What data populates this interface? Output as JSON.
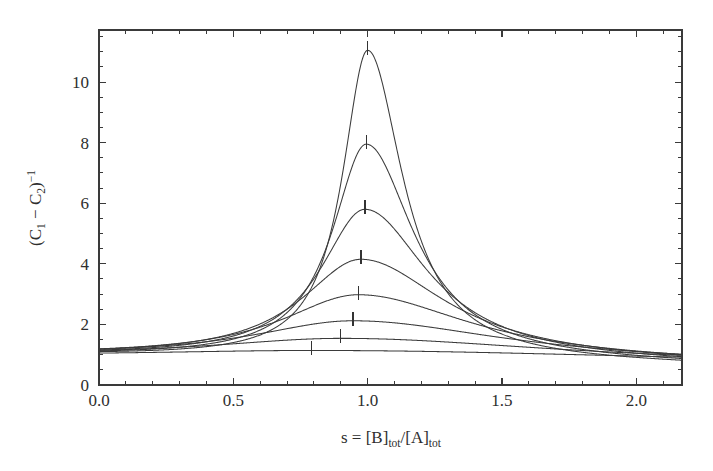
{
  "figure": {
    "background_color": "#ffffff",
    "line_color": "#3b3b3b",
    "text_color": "#2e2e2e",
    "frame_color": "#3a3a3a"
  },
  "axes": {
    "x": {
      "title_parts": {
        "variable": "s",
        "equals": " = ",
        "numerator_bracket_open": "[B]",
        "numerator_sub": "tot",
        "slash": "/",
        "denominator_bracket_open": "[A]",
        "denominator_sub": "tot"
      },
      "title_plain": "s = [B]tot/[A]tot",
      "tick_labels": [
        "0.0",
        "0.5",
        "1.0",
        "1.5",
        "2.0"
      ],
      "tick_values": [
        0.0,
        0.5,
        1.0,
        1.5,
        2.0
      ],
      "minor_tick_step": 0.1,
      "range": [
        0.0,
        2.17
      ]
    },
    "y": {
      "title_parts": {
        "paren_open": "(C",
        "sub1": "1",
        "minus": " − C",
        "sub2": "2",
        "paren_close": ")",
        "exponent": "−1"
      },
      "title_plain": "(C1 − C2)⁻¹",
      "tick_labels": [
        "0",
        "2",
        "4",
        "6",
        "8",
        "10"
      ],
      "tick_values": [
        0,
        2,
        4,
        6,
        8,
        10
      ],
      "minor_tick_step": 0.5,
      "range": [
        0.0,
        11.72
      ]
    }
  },
  "chart_data": {
    "type": "line",
    "title": "",
    "xlabel": "s = [B]tot/[A]tot",
    "ylabel": "(C1 − C2)⁻¹",
    "xlim": [
      0.0,
      2.17
    ],
    "ylim": [
      0.0,
      11.72
    ],
    "xticks": [
      0.0,
      0.5,
      1.0,
      1.5,
      2.0
    ],
    "yticks": [
      0,
      2,
      4,
      6,
      8,
      10
    ],
    "grid": false,
    "legend": "none",
    "series_count": 8,
    "curve_model": "peak at s_peak with baseline rising to left/right asymmetric lorentzian-like resonance",
    "series": [
      {
        "name": "curve-1-highest",
        "peak_x": 1.0,
        "peak_y": 11.05,
        "y_at_0": 0.97,
        "y_at_xmax": 0.63,
        "half_width": 0.115,
        "marker_x": 1.0,
        "marker_y": 11.05
      },
      {
        "name": "curve-2",
        "peak_x": 0.995,
        "peak_y": 7.95,
        "y_at_0": 0.96,
        "y_at_xmax": 0.64,
        "half_width": 0.155,
        "marker_x": 0.995,
        "marker_y": 7.95
      },
      {
        "name": "curve-3",
        "peak_x": 0.99,
        "peak_y": 5.8,
        "y_at_0": 0.955,
        "y_at_xmax": 0.655,
        "half_width": 0.205,
        "marker_x": 0.99,
        "marker_y": 5.8
      },
      {
        "name": "curve-4",
        "peak_x": 0.975,
        "peak_y": 4.15,
        "y_at_0": 0.95,
        "y_at_xmax": 0.665,
        "half_width": 0.275,
        "marker_x": 0.975,
        "marker_y": 4.15
      },
      {
        "name": "curve-5",
        "peak_x": 0.965,
        "peak_y": 2.98,
        "y_at_0": 0.945,
        "y_at_xmax": 0.675,
        "half_width": 0.36,
        "marker_x": 0.965,
        "marker_y": 2.98
      },
      {
        "name": "curve-6",
        "peak_x": 0.945,
        "peak_y": 2.12,
        "y_at_0": 0.94,
        "y_at_xmax": 0.69,
        "half_width": 0.48,
        "marker_x": 0.945,
        "marker_y": 2.12
      },
      {
        "name": "curve-7",
        "peak_x": 0.9,
        "peak_y": 1.54,
        "y_at_0": 0.935,
        "y_at_xmax": 0.7,
        "half_width": 0.65,
        "marker_x": 0.9,
        "marker_y": 1.54
      },
      {
        "name": "curve-8-lowest",
        "peak_x": 0.79,
        "peak_y": 1.14,
        "y_at_0": 0.93,
        "y_at_xmax": 0.72,
        "half_width": 0.95,
        "marker_x": 0.79,
        "marker_y": 1.14
      }
    ]
  },
  "geometry": {
    "plot_left_px": 99,
    "plot_right_px": 682,
    "plot_top_px": 30,
    "plot_bottom_px": 385
  }
}
